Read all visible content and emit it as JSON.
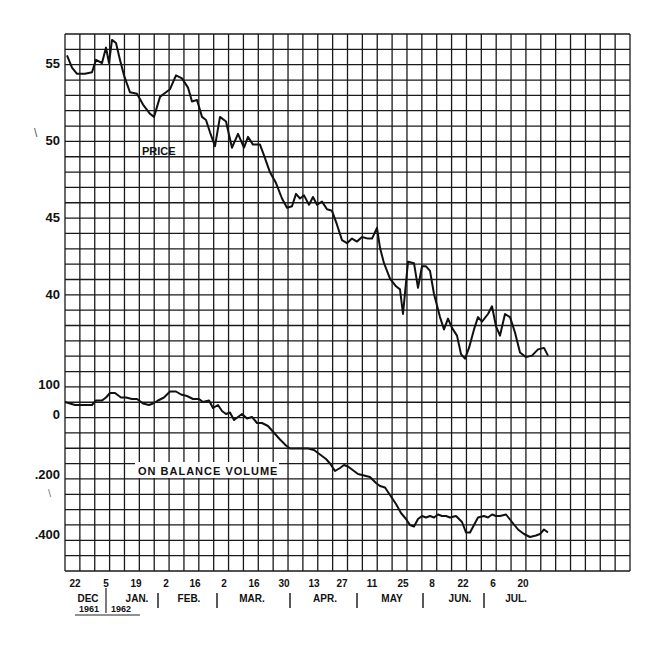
{
  "chart_data": {
    "type": "line",
    "title": "",
    "panels": [
      {
        "name": "PRICE",
        "label": "PRICE",
        "ylabel": "",
        "y_ticks": [
          55,
          50,
          45,
          40
        ],
        "ylim": [
          35,
          56.5
        ]
      },
      {
        "name": "ON BALANCE VOLUME",
        "label": "ON BALANCE VOLUME",
        "y_ticks": [
          100,
          0,
          -200,
          -400
        ],
        "y_tick_labels": [
          "100",
          "0",
          "-200",
          "-400"
        ],
        "ylim": [
          -500,
          150
        ]
      }
    ],
    "x_tick_labels": [
      "22",
      "5",
      "19",
      "2",
      "16",
      "2",
      "16",
      "30",
      "13",
      "27",
      "11",
      "25",
      "8",
      "22",
      "6",
      "20"
    ],
    "x_tick_px": [
      75,
      106,
      136,
      166,
      195,
      224,
      254,
      284,
      314,
      342,
      372,
      403,
      432,
      463,
      493,
      523
    ],
    "months": [
      {
        "label": "DEC",
        "x": 88
      },
      {
        "label": "JAN.",
        "x": 137
      },
      {
        "label": "FEB.",
        "x": 189
      },
      {
        "label": "MAR.",
        "x": 252
      },
      {
        "label": "APR.",
        "x": 325
      },
      {
        "label": "MAY",
        "x": 392
      },
      {
        "label": "JUN.",
        "x": 460
      },
      {
        "label": "JUL.",
        "x": 516
      }
    ],
    "month_separators_x": [
      106,
      158,
      217,
      290,
      357,
      423,
      484
    ],
    "years": [
      {
        "label": "1961",
        "x": 89
      },
      {
        "label": "1962",
        "x": 121
      }
    ],
    "series": [
      {
        "name": "Price",
        "x_px": [
          67,
          72,
          77,
          85,
          92,
          96,
          102,
          106,
          109,
          112,
          116,
          120,
          124,
          130,
          137,
          143,
          150,
          154,
          160,
          164,
          170,
          176,
          182,
          188,
          192,
          197,
          202,
          206,
          210,
          215,
          220,
          226,
          232,
          238,
          244,
          248,
          253,
          260,
          264,
          270,
          276,
          282,
          287,
          292,
          296,
          300,
          304,
          309,
          313,
          317,
          322,
          327,
          332,
          337,
          342,
          347,
          352,
          357,
          362,
          368,
          372,
          377,
          380,
          384,
          390,
          396,
          400,
          403,
          408,
          414,
          418,
          422,
          426,
          430,
          434,
          440,
          444,
          448,
          452,
          457,
          461,
          465,
          469,
          474,
          478,
          482,
          488,
          492,
          496,
          500,
          505,
          510,
          515,
          520,
          526,
          532,
          538,
          544,
          548
        ],
        "values": [
          55.5,
          54.7,
          54.3,
          54.3,
          54.4,
          55.2,
          55.0,
          56.0,
          55.0,
          56.5,
          56.3,
          55.2,
          54.2,
          53.1,
          53.0,
          52.3,
          51.7,
          51.5,
          52.8,
          53.0,
          53.3,
          54.2,
          54.0,
          53.4,
          52.5,
          52.6,
          51.5,
          51.3,
          50.5,
          49.6,
          51.5,
          51.2,
          49.5,
          50.4,
          49.5,
          50.2,
          49.7,
          49.7,
          49.0,
          47.9,
          47.2,
          46.2,
          45.6,
          45.7,
          46.5,
          46.2,
          46.4,
          45.8,
          46.3,
          45.8,
          46.0,
          45.5,
          45.4,
          44.5,
          43.5,
          43.3,
          43.6,
          43.4,
          43.7,
          43.6,
          43.6,
          44.3,
          43.0,
          42.0,
          41.0,
          40.5,
          40.3,
          38.7,
          42.1,
          42.0,
          40.4,
          41.8,
          41.8,
          41.5,
          40.0,
          38.5,
          37.7,
          38.4,
          37.8,
          37.3,
          36.1,
          35.8,
          36.5,
          37.7,
          38.5,
          38.2,
          38.7,
          39.2,
          37.9,
          37.3,
          38.7,
          38.5,
          37.5,
          36.2,
          35.9,
          36.0,
          36.4,
          36.5,
          36.0
        ]
      },
      {
        "name": "On Balance Volume",
        "x_px": [
          65,
          70,
          75,
          85,
          92,
          96,
          102,
          106,
          110,
          115,
          121,
          126,
          132,
          137,
          143,
          149,
          153,
          158,
          164,
          170,
          176,
          181,
          187,
          193,
          199,
          203,
          209,
          213,
          218,
          222,
          226,
          230,
          234,
          238,
          242,
          247,
          252,
          257,
          262,
          268,
          272,
          276,
          280,
          286,
          290,
          296,
          302,
          308,
          314,
          318,
          322,
          326,
          330,
          335,
          340,
          344,
          348,
          352,
          358,
          364,
          370,
          376,
          380,
          385,
          390,
          396,
          401,
          406,
          410,
          414,
          418,
          422,
          426,
          430,
          434,
          438,
          442,
          446,
          450,
          456,
          462,
          466,
          470,
          474,
          478,
          484,
          488,
          492,
          496,
          500,
          506,
          512,
          518,
          524,
          530,
          536,
          540,
          544,
          548
        ],
        "values": [
          40,
          35,
          30,
          30,
          30,
          45,
          45,
          55,
          70,
          70,
          55,
          55,
          50,
          50,
          35,
          30,
          35,
          45,
          55,
          75,
          75,
          65,
          60,
          50,
          50,
          40,
          45,
          20,
          30,
          10,
          0,
          5,
          -20,
          -10,
          0,
          -15,
          -10,
          -30,
          -30,
          -40,
          -55,
          -70,
          -85,
          -105,
          -115,
          -115,
          -115,
          -115,
          -120,
          -130,
          -140,
          -150,
          -165,
          -190,
          -180,
          -170,
          -175,
          -185,
          -200,
          -205,
          -210,
          -230,
          -240,
          -245,
          -270,
          -300,
          -330,
          -350,
          -370,
          -375,
          -350,
          -340,
          -345,
          -340,
          -345,
          -335,
          -340,
          -340,
          -345,
          -340,
          -360,
          -395,
          -395,
          -370,
          -345,
          -340,
          -345,
          -335,
          -340,
          -340,
          -335,
          -360,
          -385,
          -400,
          -410,
          -405,
          -400,
          -385,
          -395
        ]
      }
    ]
  }
}
